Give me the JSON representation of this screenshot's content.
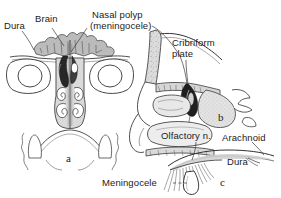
{
  "figure": {
    "background_color": "#ffffff",
    "ink_color": "#2b2b2b",
    "wash_color": "#b9b9b9",
    "width": 281,
    "height": 198
  },
  "labels": {
    "dura_top": "Dura",
    "brain": "Brain",
    "nasal_polyp_line1": "Nasal polyp",
    "nasal_polyp_line2": "(meningocele)",
    "cribriform_line1": "Cribriform",
    "cribriform_line2": "plate",
    "olfactory_nerve": "Olfactory n.",
    "arachnoid": "Arachnoid",
    "dura_detail": "Dura",
    "meningocele": "Meningocele"
  },
  "panels": [
    {
      "id": "a",
      "caption": "a",
      "view": "coronal-section"
    },
    {
      "id": "b",
      "caption": "b",
      "view": "sagittal-section"
    },
    {
      "id": "c",
      "caption": "c",
      "view": "detail-view"
    }
  ]
}
